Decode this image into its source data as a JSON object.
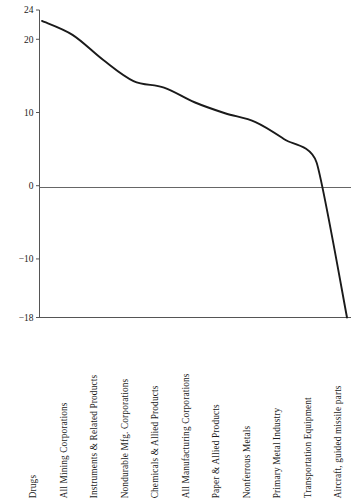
{
  "chart_data": {
    "type": "line",
    "title": "",
    "subtitle": "",
    "xlabel": "",
    "ylabel": "",
    "grid": false,
    "legend": "none",
    "ylim": [
      -18,
      24
    ],
    "yticks": [
      24,
      20,
      10,
      0,
      -10,
      -18
    ],
    "ytick_labels": [
      "24",
      "20",
      "10",
      "0",
      "−10",
      "−18"
    ],
    "zero_line": 0,
    "categories": [
      "Drugs",
      "All Mining Corporations",
      "Instruments & Related Products",
      "Nondurable Mfg. Corporations",
      "Chemicals & Allied Products",
      "All Manufacturing Corporations",
      "Paper & Allied Products",
      "Nonferrous Metals",
      "Primary Metal Industry",
      "Transportation Equipment",
      "Aircraft, guided missile parts"
    ],
    "values": [
      22.5,
      20.6,
      17.2,
      14.3,
      13.4,
      11.4,
      9.9,
      8.7,
      6.2,
      3.2,
      -18.0
    ],
    "line_color": "#1a1a1a",
    "axis_color": "#555555"
  }
}
